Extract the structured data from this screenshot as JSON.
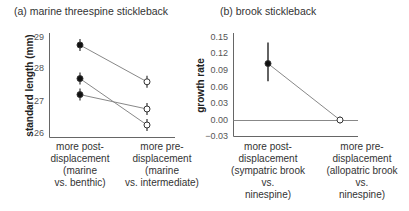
{
  "chart_data": [
    {
      "type": "line",
      "panel": "a",
      "title": "(a)  marine threespine stickleback",
      "ylabel": "standard length (mm)",
      "xlabel": "",
      "ylim": [
        26,
        29
      ],
      "yticks": [
        "29",
        "28",
        "27",
        "26"
      ],
      "categories": [
        "more post-\ndisplacement\n(marine\nvs. benthic)",
        "more pre-\ndisplacement\n(marine\nvs. intermediate)"
      ],
      "series": [
        {
          "name": "line 1",
          "values": [
            28.75,
            27.6
          ],
          "markers": [
            "filled",
            "open"
          ]
        },
        {
          "name": "line 2",
          "values": [
            27.7,
            26.25
          ],
          "markers": [
            "filled",
            "open"
          ]
        },
        {
          "name": "line 3",
          "values": [
            27.2,
            26.75
          ],
          "markers": [
            "filled",
            "open"
          ]
        }
      ],
      "error_bars": true,
      "grid": false
    },
    {
      "type": "line",
      "panel": "b",
      "title": "(b)  brook stickleback",
      "ylabel": "growth rate",
      "xlabel": "",
      "ylim": [
        -0.03,
        0.15
      ],
      "yticks": [
        "0.15",
        "0.12",
        "0.09",
        "0.06",
        "0.03",
        "0.00",
        "−0.03"
      ],
      "categories": [
        "more post-\ndisplacement\n(sympatric brook\nvs.\nninespine)",
        "more pre-\ndisplacement\n(allopatric brook\nvs.\nninespine)"
      ],
      "series": [
        {
          "name": "growth rate",
          "values": [
            0.102,
            0.0
          ],
          "markers": [
            "filled",
            "open"
          ],
          "error_low": [
            0.07,
            -0.006
          ],
          "error_high": [
            0.14,
            0.006
          ]
        }
      ],
      "reference_line": 0.0,
      "grid": false
    }
  ]
}
